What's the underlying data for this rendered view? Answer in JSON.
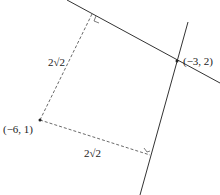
{
  "diagram": {
    "points": [
      {
        "id": "intersection",
        "label": "(−3, 2)"
      },
      {
        "id": "external-point",
        "label": "(−6, 1)"
      }
    ],
    "distances": [
      {
        "id": "distance-to-line-1",
        "label": "2√2"
      },
      {
        "id": "distance-to-line-2",
        "label": "2√2"
      }
    ],
    "colors": {
      "solid_line": "#333333",
      "dashed_line": "#444444",
      "text": "#222222"
    }
  }
}
